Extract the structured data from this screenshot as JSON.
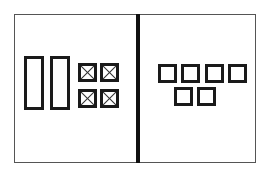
{
  "diagram": {
    "frame": {
      "x": 14,
      "y": 14,
      "w": 242,
      "h": 149,
      "color": "#555555"
    },
    "divider": {
      "x": 136,
      "w": 4,
      "color": "#111111"
    },
    "left_panel": {
      "tall_rectangles": [
        {
          "x": 24,
          "y": 56,
          "w": 20,
          "h": 54
        },
        {
          "x": 50,
          "y": 56,
          "w": 20,
          "h": 54
        }
      ],
      "crossed_boxes": [
        {
          "x": 78,
          "y": 63,
          "w": 19,
          "h": 19
        },
        {
          "x": 100,
          "y": 63,
          "w": 19,
          "h": 19
        },
        {
          "x": 78,
          "y": 89,
          "w": 19,
          "h": 19
        },
        {
          "x": 100,
          "y": 89,
          "w": 19,
          "h": 19
        }
      ]
    },
    "right_panel": {
      "squares": [
        {
          "x": 158,
          "y": 64,
          "w": 19,
          "h": 19
        },
        {
          "x": 181,
          "y": 64,
          "w": 19,
          "h": 19
        },
        {
          "x": 205,
          "y": 64,
          "w": 19,
          "h": 19
        },
        {
          "x": 228,
          "y": 64,
          "w": 19,
          "h": 19
        },
        {
          "x": 174,
          "y": 87,
          "w": 19,
          "h": 19
        },
        {
          "x": 197,
          "y": 87,
          "w": 19,
          "h": 19
        }
      ]
    },
    "stroke_color": "#1a1a1a"
  }
}
